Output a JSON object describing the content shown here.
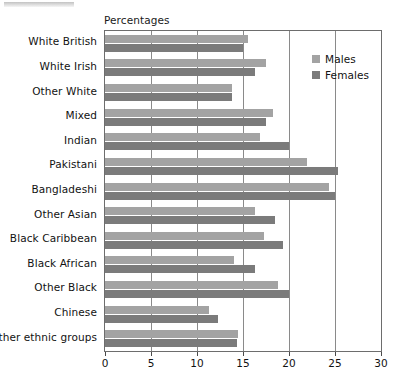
{
  "axis_title": "Percentages",
  "legend": {
    "position": "inside-right",
    "entries": [
      {
        "label": "Males",
        "color": "#a3a3a3",
        "swatch_name": "males-swatch"
      },
      {
        "label": "Females",
        "color": "#7b7b7b",
        "swatch_name": "females-swatch"
      }
    ]
  },
  "x_ticks": [
    "0",
    "5",
    "10",
    "15",
    "20",
    "25",
    "30"
  ],
  "chart_data": {
    "type": "bar",
    "orientation": "horizontal",
    "title": "",
    "subtitle": "",
    "xlabel": "Percentages",
    "ylabel": "",
    "xlim": [
      0,
      30
    ],
    "xticks": [
      0,
      5,
      10,
      15,
      20,
      25,
      30
    ],
    "grid": true,
    "grid_axis": "x",
    "legend_position": "inside-right",
    "categories": [
      "White British",
      "White Irish",
      "Other White",
      "Mixed",
      "Indian",
      "Pakistani",
      "Bangladeshi",
      "Other Asian",
      "Black Caribbean",
      "Black African",
      "Other Black",
      "Chinese",
      "Other ethnic groups"
    ],
    "series": [
      {
        "name": "Males",
        "color": "#a3a3a3",
        "values": [
          15.5,
          17.5,
          13.8,
          18.3,
          16.8,
          22.0,
          24.3,
          16.3,
          17.3,
          14.0,
          18.8,
          11.3,
          14.5
        ]
      },
      {
        "name": "Females",
        "color": "#7b7b7b",
        "values": [
          15.0,
          16.3,
          13.8,
          17.5,
          20.0,
          25.3,
          25.0,
          18.5,
          19.3,
          16.3,
          20.0,
          12.3,
          14.3
        ]
      }
    ]
  }
}
